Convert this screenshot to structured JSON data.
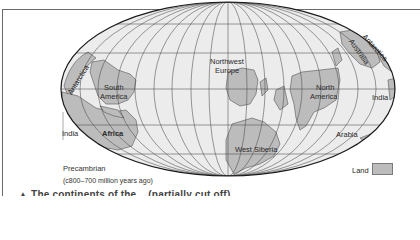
{
  "map": {
    "projection": "elliptical equal-area world projection with graticule",
    "colors": {
      "ocean": "#ececec",
      "land": "#bcbcbc",
      "graticule": "#4a4a4a",
      "outline": "#1a1a1a"
    },
    "landmass_labels": {
      "antarctica_west": "Antarctica",
      "south_america_1": "South",
      "south_america_2": "America",
      "africa": "Africa",
      "india_west": "India",
      "northwest_europe_1": "Northwest",
      "northwest_europe_2": "Europe",
      "north_america_1": "North",
      "north_america_2": "America",
      "australia": "Australia",
      "antarctica_east": "Antarctica",
      "india_east": "India",
      "arabia": "Arabia",
      "west_siberia": "West Siberia"
    },
    "era": {
      "title": "Precambrian",
      "range": "(c800–700 million years ago)"
    },
    "legend": {
      "land_label": "Land"
    }
  },
  "caption": {
    "partial_text": "▲ The continents of the... (partially cut off)"
  }
}
